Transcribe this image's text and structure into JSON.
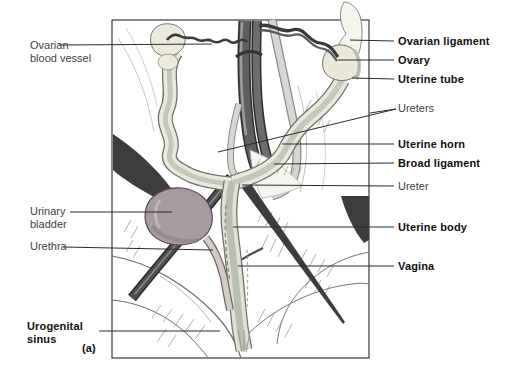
{
  "figure": {
    "title_semantic": "Female urogenital system diagram (cat dissection, lateral-ventral view)",
    "panel_letter": "(a)",
    "left_labels": [
      {
        "id": "ovarian-blood-vessel",
        "text": "Ovarian\nblood vessel",
        "bold": false
      },
      {
        "id": "urinary-bladder",
        "text": "Urinary\nbladder",
        "bold": false
      },
      {
        "id": "urethra",
        "text": "Urethra",
        "bold": false
      },
      {
        "id": "urogenital-sinus",
        "text": "Urogenital\nsinus",
        "bold": true
      }
    ],
    "right_labels": [
      {
        "id": "ovarian-ligament",
        "text": "Ovarian ligament",
        "bold": true
      },
      {
        "id": "ovary",
        "text": "Ovary",
        "bold": true
      },
      {
        "id": "uterine-tube",
        "text": "Uterine tube",
        "bold": true
      },
      {
        "id": "ureters",
        "text": "Ureters",
        "bold": false
      },
      {
        "id": "uterine-horn",
        "text": "Uterine horn",
        "bold": true
      },
      {
        "id": "broad-ligament",
        "text": "Broad ligament",
        "bold": true
      },
      {
        "id": "ureter",
        "text": "Ureter",
        "bold": false
      },
      {
        "id": "uterine-body",
        "text": "Uterine body",
        "bold": true
      },
      {
        "id": "vagina",
        "text": "Vagina",
        "bold": true
      }
    ],
    "colors": {
      "bladder": "#a79aa0",
      "vessel_dark": "#5f5f5f",
      "tube_cream": "#e9e8df",
      "tube_inner": "#c2c8ba",
      "wedge_dark": "#3d3d3d",
      "label_text": "#3f3f3f",
      "label_bold_text": "#101010"
    }
  }
}
